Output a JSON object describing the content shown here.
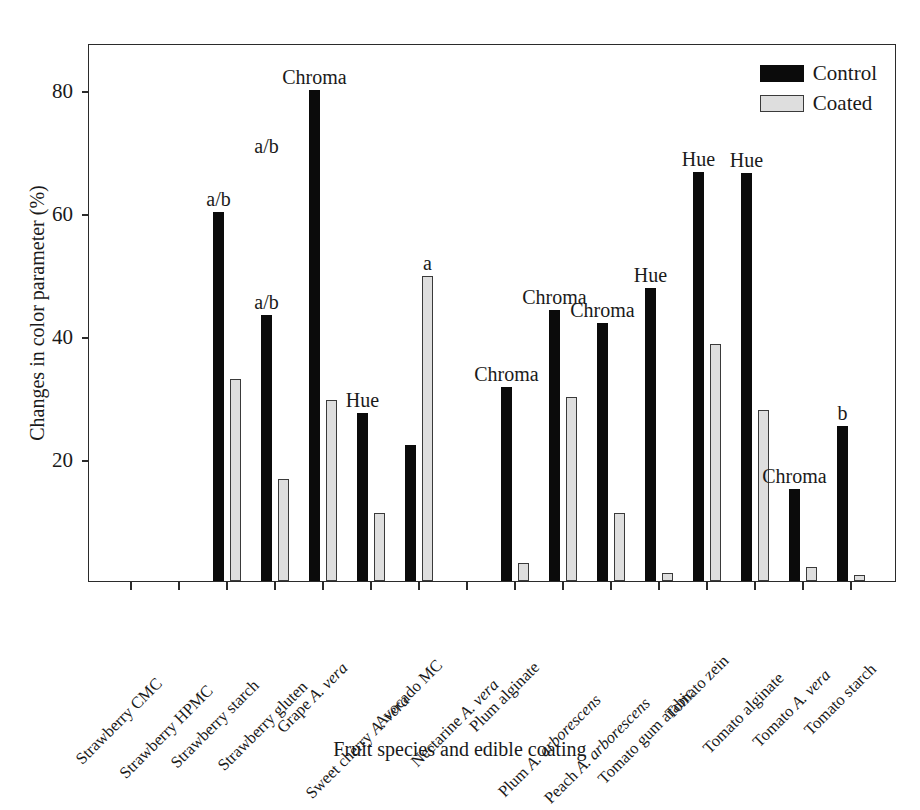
{
  "chart_data": {
    "type": "bar",
    "title": "",
    "xlabel": "Fruit species and edible coating",
    "ylabel": "Changes in color parameter (%)",
    "ylim": [
      0,
      87.5
    ],
    "yticks": [
      20,
      40,
      60,
      80
    ],
    "ytick_labels": [
      "20",
      "40",
      "60",
      "80"
    ],
    "grid": false,
    "legend_position": "top-right",
    "categories": [
      "Strawberry CMC",
      "Strawberry HPMC",
      "Strawberry starch",
      "Strawberry gluten",
      "Grape A. vera",
      "Sweet cherry A. vera",
      "Avocado MC",
      "Nectarine A. vera",
      "Plum alginate",
      "Plum A. arborescens",
      "Peach A. arborescens",
      "Tomato gum arabic",
      "Tomato zein",
      "Tomato alginate",
      "Tomato A. vera",
      "Tomato starch"
    ],
    "category_italic_tails": [
      "",
      "",
      "",
      "",
      "A. vera",
      "A. vera",
      "",
      "A. vera",
      "",
      "A. arborescens",
      "A. arborescens",
      "",
      "",
      "",
      "A. vera",
      ""
    ],
    "series": [
      {
        "name": "Control",
        "color": "#0b0b0b",
        "values": [
          0,
          0,
          60.0,
          43.2,
          79.8,
          27.4,
          22.2,
          0,
          31.5,
          44.1,
          42.0,
          47.7,
          66.5,
          66.4,
          15.0,
          25.2
        ]
      },
      {
        "name": "Coated",
        "color": "#dedede",
        "values": [
          0,
          0,
          32.9,
          16.6,
          29.4,
          11.0,
          49.6,
          0,
          3.0,
          29.9,
          11.0,
          1.3,
          38.5,
          27.8,
          2.2,
          0.9
        ]
      }
    ],
    "annotations": [
      {
        "category": "Strawberry starch",
        "text": "a/b",
        "value": 60.0
      },
      {
        "category": "Strawberry gluten",
        "text": "a/b",
        "value": 43.2
      },
      {
        "category": "Grape A. vera",
        "text": "Chroma",
        "value": 79.8
      },
      {
        "category": "Sweet cherry A. vera",
        "text": "Hue",
        "value": 27.4
      },
      {
        "category": "Avocado MC",
        "text": "a",
        "value": 49.6
      },
      {
        "category": "Plum alginate",
        "text": "Chroma",
        "value": 31.5
      },
      {
        "category": "Plum A. arborescens",
        "text": "Chroma",
        "value": 44.1
      },
      {
        "category": "Peach A. arborescens",
        "text": "Chroma",
        "value": 42.0
      },
      {
        "category": "Tomato gum arabic",
        "text": "Hue",
        "value": 47.7
      },
      {
        "category": "Tomato zein",
        "text": "Hue",
        "value": 66.5
      },
      {
        "category": "Tomato alginate",
        "text": "Hue",
        "value": 66.4
      },
      {
        "category": "Tomato A. vera",
        "text": "Chroma",
        "value": 15.0
      },
      {
        "category": "Tomato starch",
        "text": "b",
        "value": 25.2
      }
    ],
    "extra_annotation_above": {
      "Strawberry gluten": "a/b"
    }
  },
  "legend": {
    "items": [
      {
        "label": "Control",
        "swatch": "control-swatch"
      },
      {
        "label": "Coated",
        "swatch": "coated-swatch"
      }
    ]
  },
  "axes": {
    "y_title": "Changes in color parameter (%)",
    "x_title": "Fruit species and edible coating"
  }
}
